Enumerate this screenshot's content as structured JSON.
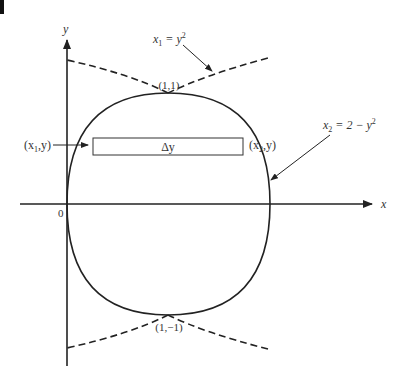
{
  "figure": {
    "axes": {
      "x_label": "x",
      "y_label": "y",
      "origin_label": "0"
    },
    "curves": [
      {
        "name": "x1 = y^2",
        "label_main": "x",
        "label_sub": "1",
        "label_rest": " = y",
        "label_sup": "2",
        "style": "solid-inside / dashed-outside"
      },
      {
        "name": "x2 = 2 - y^2",
        "label_main": "x",
        "label_sub": "2",
        "label_rest": " = 2 − y",
        "label_sup": "2",
        "style": "solid-inside / dashed-outside"
      }
    ],
    "points": {
      "top": "(1,1)",
      "bottom": "(1,−1)"
    },
    "strip": {
      "label": "Δy",
      "left_point": {
        "open": "(x",
        "sub": "1",
        "close": ",y)"
      },
      "right_point": {
        "open": "(x",
        "sub": "2",
        "close": ",y)"
      }
    }
  },
  "colors": {
    "ink": "#222222",
    "label": "#333333",
    "background": "#ffffff"
  }
}
